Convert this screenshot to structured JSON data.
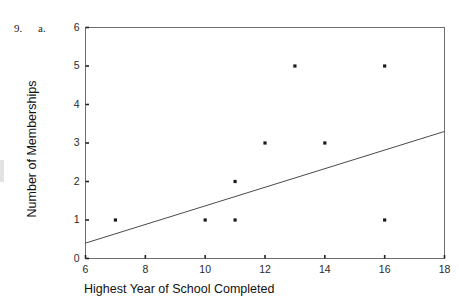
{
  "scan": {
    "header_fragment": "",
    "item_number": "9.",
    "item_part": "a."
  },
  "chart_data": {
    "type": "scatter",
    "title": "",
    "xlabel": "Highest Year of School Completed",
    "ylabel": "Number of Memberships",
    "xlim": [
      6,
      18
    ],
    "ylim": [
      0,
      6
    ],
    "xticks": [
      6,
      8,
      10,
      12,
      14,
      16,
      18
    ],
    "yticks": [
      0,
      1,
      2,
      3,
      4,
      5,
      6
    ],
    "xtick_labels": [
      "6",
      "8",
      "10",
      "12",
      "14",
      "16",
      "18"
    ],
    "ytick_labels": [
      "0",
      "1",
      "2",
      "3",
      "4",
      "5",
      "6"
    ],
    "grid": false,
    "legend": null,
    "marker_color": "#1a1a1a",
    "line_color": "#4a4a4a",
    "axis_color": "#6e6e6e",
    "points": [
      {
        "x": 7,
        "y": 1
      },
      {
        "x": 10,
        "y": 1
      },
      {
        "x": 11,
        "y": 1
      },
      {
        "x": 11,
        "y": 2
      },
      {
        "x": 12,
        "y": 3
      },
      {
        "x": 13,
        "y": 5
      },
      {
        "x": 14,
        "y": 3
      },
      {
        "x": 16,
        "y": 5
      },
      {
        "x": 16,
        "y": 1
      }
    ],
    "trendline": {
      "x1": 6,
      "y1": 0.4,
      "x2": 18,
      "y2": 3.3
    }
  }
}
